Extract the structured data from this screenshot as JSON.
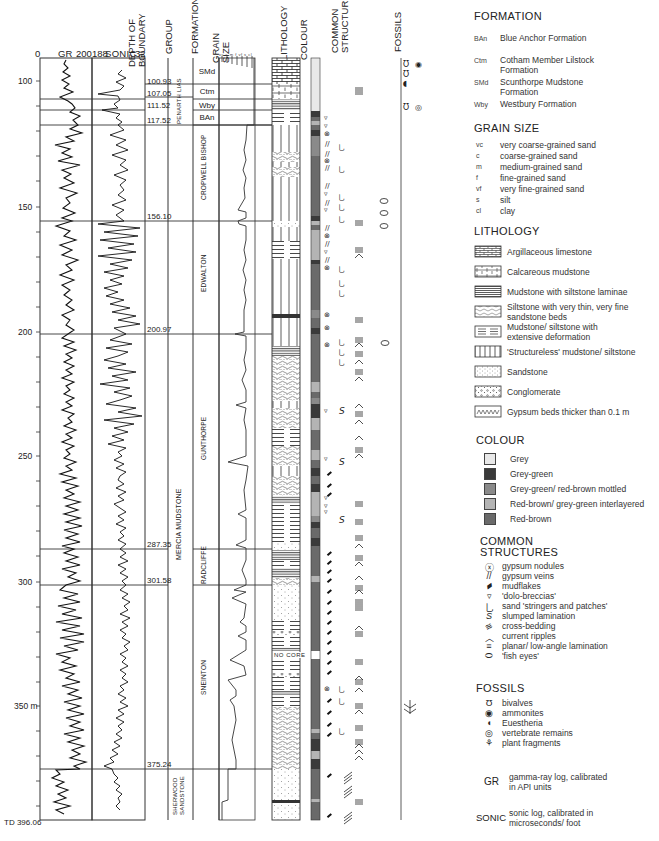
{
  "headers": {
    "gr_min": "0",
    "gr_label": "GR",
    "gr_max": "200",
    "sonic_min": "188",
    "sonic_label": "SONIC",
    "sonic_max": "32",
    "depth_of_boundary": "DEPTH OF BOUNDARY",
    "group": "GROUP",
    "formation": "FORMATION",
    "grain_size": "GRAIN SIZE",
    "grain_scale": "vc c m f vf s cl",
    "lithology": "LITHOLOGY",
    "colour": "COLOUR",
    "common_structures": "COMMON STRUCTURES",
    "fossils": "FOSSILS"
  },
  "depth_axis": {
    "labels": [
      {
        "text": "100",
        "depth": 100
      },
      {
        "text": "150",
        "depth": 150
      },
      {
        "text": "200",
        "depth": 200
      },
      {
        "text": "250",
        "depth": 250
      },
      {
        "text": "300",
        "depth": 300
      },
      {
        "text": "350 m",
        "depth": 350
      }
    ],
    "td_label": "TD 396.06"
  },
  "boundaries": [
    {
      "text": "100.93",
      "depth": 100.93
    },
    {
      "text": "107.05",
      "depth": 107.05
    },
    {
      "text": "111.52",
      "depth": 111.52
    },
    {
      "text": "117.52",
      "depth": 117.52
    },
    {
      "text": "156.10",
      "depth": 156.1
    },
    {
      "text": "200.97",
      "depth": 200.97
    },
    {
      "text": "287.35",
      "depth": 287.35
    },
    {
      "text": "301.58",
      "depth": 301.58
    },
    {
      "text": "375.24",
      "depth": 375.24
    }
  ],
  "groups": [
    {
      "name": "LIAS",
      "top": 91,
      "base": 107.05
    },
    {
      "name": "PENARTH",
      "top": 107.05,
      "base": 117.52
    },
    {
      "name": "MERCIA MUDSTONE",
      "top": 117.52,
      "base": 375.24
    },
    {
      "name": "SHERWOOD SANDSTONE",
      "top": 375.24,
      "base": 396.06
    }
  ],
  "formations": [
    {
      "name": "SMd",
      "top": 91,
      "base": 100.93
    },
    {
      "name": "Ctm",
      "top": 100.93,
      "base": 107.05
    },
    {
      "name": "Wby",
      "top": 107.05,
      "base": 111.52
    },
    {
      "name": "BAn",
      "top": 111.52,
      "base": 117.52
    },
    {
      "name": "CROPWELL BISHOP",
      "top": 117.52,
      "base": 156.1
    },
    {
      "name": "EDWALTON",
      "top": 156.1,
      "base": 200.97
    },
    {
      "name": "GUNTHORPE",
      "top": 200.97,
      "base": 287.35
    },
    {
      "name": "RADCLIFFE",
      "top": 287.35,
      "base": 301.58
    },
    {
      "name": "SNEINTON",
      "top": 301.58,
      "base": 375.24
    },
    {
      "name": "",
      "top": 375.24,
      "base": 396.06
    }
  ],
  "no_core_label": "NO CORE",
  "colours": {
    "grey": "#e8e8e8",
    "grey_green": "#3a3a3a",
    "mottled": "#8a8a8a",
    "interlayered": "#b4b4b4",
    "red_brown": "#6a6a6a"
  },
  "legend": {
    "formation": {
      "title": "FORMATION",
      "items": [
        {
          "abbr": "BAn",
          "text": "Blue Anchor Formation"
        },
        {
          "abbr": "Ctm",
          "text": "Cotham Member Lilstock Formation"
        },
        {
          "abbr": "SMd",
          "text": "Scunthorpe Mudstone Formation"
        },
        {
          "abbr": "Wby",
          "text": "Westbury Formation"
        }
      ]
    },
    "grain_size": {
      "title": "GRAIN SIZE",
      "items": [
        {
          "abbr": "vc",
          "text": "very coarse-grained sand"
        },
        {
          "abbr": "c",
          "text": "coarse-grained sand"
        },
        {
          "abbr": "m",
          "text": "medium-grained sand"
        },
        {
          "abbr": "f",
          "text": "fine-grained sand"
        },
        {
          "abbr": "vf",
          "text": "very fine-grained sand"
        },
        {
          "abbr": "s",
          "text": "silt"
        },
        {
          "abbr": "cl",
          "text": "clay"
        }
      ]
    },
    "lithology": {
      "title": "LITHOLOGY",
      "items": [
        {
          "pattern": "argillaceous-limestone",
          "text": "Argillaceous limestone"
        },
        {
          "pattern": "calcareous-mudstone",
          "text": "Calcareous mudstone"
        },
        {
          "pattern": "mudstone-siltstone-laminae",
          "text": "Mudstone with siltstone laminae"
        },
        {
          "pattern": "siltstone-sandstone-beds",
          "text": "Siltstone with very thin, very fine sandstone beds"
        },
        {
          "pattern": "deformed-mudstone",
          "text": "Mudstone/ siltstone with extensive deformation"
        },
        {
          "pattern": "structureless",
          "text": "'Structureless' mudstone/ siltstone"
        },
        {
          "pattern": "sandstone",
          "text": "Sandstone"
        },
        {
          "pattern": "conglomerate",
          "text": "Conglomerate"
        },
        {
          "pattern": "gypsum-beds",
          "text": "Gypsum beds thicker than 0.1 m"
        }
      ]
    },
    "colour": {
      "title": "COLOUR",
      "items": [
        {
          "swatch": "#e8e8e8",
          "text": "Grey"
        },
        {
          "swatch": "#3a3a3a",
          "text": "Grey-green"
        },
        {
          "swatch": "#8a8a8a",
          "text": "Grey-green/ red-brown mottled"
        },
        {
          "swatch": "#b4b4b4",
          "text": "Red-brown/ grey-green interlayered"
        },
        {
          "swatch": "#6a6a6a",
          "text": "Red-brown"
        }
      ]
    },
    "structures": {
      "title_line1": "COMMON",
      "title_line2": "STRUCTURES",
      "items": [
        {
          "glyph": "ⓧ",
          "text": "gypsum nodules"
        },
        {
          "glyph": "//",
          "text": "gypsum veins"
        },
        {
          "glyph": "▰",
          "text": "mudflakes"
        },
        {
          "glyph": "▿",
          "text": "'dolo-breccias'"
        },
        {
          "glyph": "⺃",
          "text": "sand 'stringers and patches'"
        },
        {
          "glyph": "S",
          "text": "slumped lamination"
        },
        {
          "glyph": "≋",
          "text": "cross-bedding"
        },
        {
          "glyph": "︿",
          "text": "current ripples"
        },
        {
          "glyph": "≡",
          "text": "planar/ low-angle lamination"
        },
        {
          "glyph": "⬭",
          "text": "'fish eyes'"
        }
      ]
    },
    "fossils": {
      "title": "FOSSILS",
      "items": [
        {
          "glyph": "Ʊ",
          "text": "bivalves"
        },
        {
          "glyph": "◉",
          "text": "ammonites"
        },
        {
          "glyph": "◖",
          "text": "Euestheria"
        },
        {
          "glyph": "◎",
          "text": "vertebrate remains"
        },
        {
          "glyph": "⚘",
          "text": "plant fragments"
        }
      ]
    },
    "logs": [
      {
        "abbr": "GR",
        "text": "gamma-ray log, calibrated in API units"
      },
      {
        "abbr": "SONIC",
        "text": "sonic log, calibrated in microseconds/ foot"
      }
    ]
  }
}
